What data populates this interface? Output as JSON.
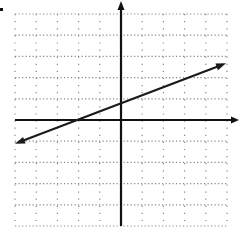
{
  "chart_data": {
    "type": "line",
    "title": "",
    "xlabel": "",
    "ylabel": "",
    "xlim": [
      -5,
      5
    ],
    "ylim": [
      -5,
      5
    ],
    "grid": true,
    "grid_style": "dotted",
    "minor_grid_per_unit": 3,
    "axes": {
      "x_arrow_right": true,
      "y_arrow_top": true
    },
    "series": [
      {
        "name": "line",
        "equation": "y = 0.4x + 0.8",
        "slope": 0.4,
        "intercept": 0.8,
        "x_intercept": -2,
        "x": [
          -5,
          5
        ],
        "y": [
          -1.1,
          2.7
        ],
        "arrows": "both",
        "color": "#1a1a1a"
      }
    ]
  },
  "colors": {
    "axis": "#111111",
    "grid": "#888888",
    "line": "#1a1a1a",
    "background": "#ffffff"
  }
}
